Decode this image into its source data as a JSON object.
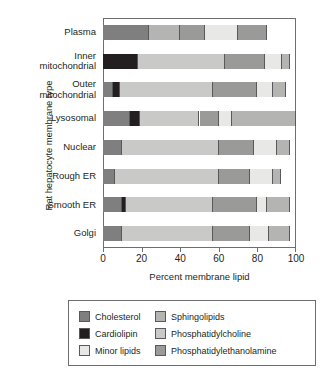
{
  "chart_data": {
    "type": "bar",
    "orientation": "horizontal",
    "stacked": true,
    "title": "",
    "xlabel": "Percent membrane lipid",
    "ylabel": "Rat hepatocyte membrane type",
    "xlim": [
      0,
      100
    ],
    "xticks": [
      0,
      20,
      40,
      60,
      80,
      100
    ],
    "grid": false,
    "legend_position": "below",
    "categories": [
      "Plasma",
      "Inner mitochondrial",
      "Outer mitochondrial",
      "Lysosomal",
      "Nuclear",
      "Rough ER",
      "Smooth ER",
      "Golgi"
    ],
    "category_lines": [
      [
        "Plasma"
      ],
      [
        "Inner",
        "mitochondrial"
      ],
      [
        "Outer",
        "mitochondrial"
      ],
      [
        "Lysosomal"
      ],
      [
        "Nuclear"
      ],
      [
        "Rough ER"
      ],
      [
        "Smooth ER"
      ],
      [
        "Golgi"
      ]
    ],
    "series": [
      {
        "name": "Cholesterol",
        "key": "cholesterol",
        "color": "#7f7f7f",
        "values": [
          24,
          0,
          5,
          14,
          10,
          6,
          10,
          10
        ]
      },
      {
        "name": "Cardiolipin",
        "key": "cardiolipin",
        "color": "#231f20",
        "values": [
          0,
          18,
          4,
          5,
          0,
          0,
          2,
          0
        ]
      },
      {
        "name": "Minor lipids",
        "key": "minor",
        "color": "#e8e8e6",
        "values": [
          17,
          9,
          8,
          7,
          12,
          12,
          5,
          10
        ]
      },
      {
        "name": "Sphingolipids",
        "key": "sphingolipids",
        "color": "#b4b4b2",
        "values": [
          16,
          4,
          7,
          33,
          7,
          4,
          12,
          11
        ]
      },
      {
        "name": "Phosphatidylcholine",
        "key": "pc",
        "color": "#c9c9c7",
        "values": [
          0,
          45,
          48,
          31,
          50,
          54,
          45,
          47
        ]
      },
      {
        "name": "Phosphatidylethanolamine",
        "key": "pe",
        "color": "#9a9a98",
        "values": [
          28,
          21,
          23,
          10,
          18,
          16,
          23,
          19
        ]
      }
    ],
    "stacks": [
      {
        "category": "Plasma",
        "segments": [
          {
            "key": "cholesterol",
            "start": 0,
            "end": 24
          },
          {
            "key": "sphingolipids",
            "start": 24,
            "end": 40
          },
          {
            "key": "pe",
            "start": 40,
            "end": 53
          },
          {
            "key": "minor",
            "start": 53,
            "end": 70
          },
          {
            "key": "pe",
            "start": 70,
            "end": 85
          }
        ]
      },
      {
        "category": "Inner mitochondrial",
        "segments": [
          {
            "key": "cardiolipin",
            "start": 0,
            "end": 18
          },
          {
            "key": "pc",
            "start": 18,
            "end": 63
          },
          {
            "key": "pe",
            "start": 63,
            "end": 84
          },
          {
            "key": "minor",
            "start": 84,
            "end": 93
          },
          {
            "key": "sphingolipids",
            "start": 93,
            "end": 97
          }
        ]
      },
      {
        "category": "Outer mitochondrial",
        "segments": [
          {
            "key": "cholesterol",
            "start": 0,
            "end": 5
          },
          {
            "key": "cardiolipin",
            "start": 5,
            "end": 9
          },
          {
            "key": "pc",
            "start": 9,
            "end": 57
          },
          {
            "key": "pe",
            "start": 57,
            "end": 80
          },
          {
            "key": "minor",
            "start": 80,
            "end": 88
          },
          {
            "key": "sphingolipids",
            "start": 88,
            "end": 95
          }
        ]
      },
      {
        "category": "Lysosomal",
        "segments": [
          {
            "key": "cholesterol",
            "start": 0,
            "end": 14
          },
          {
            "key": "cardiolipin",
            "start": 14,
            "end": 19
          },
          {
            "key": "pc",
            "start": 19,
            "end": 50
          },
          {
            "key": "pe",
            "start": 50,
            "end": 60
          },
          {
            "key": "minor",
            "start": 60,
            "end": 67
          },
          {
            "key": "sphingolipids",
            "start": 67,
            "end": 100
          }
        ]
      },
      {
        "category": "Nuclear",
        "segments": [
          {
            "key": "cholesterol",
            "start": 0,
            "end": 10
          },
          {
            "key": "pc",
            "start": 10,
            "end": 60
          },
          {
            "key": "pe",
            "start": 60,
            "end": 78
          },
          {
            "key": "minor",
            "start": 78,
            "end": 90
          },
          {
            "key": "sphingolipids",
            "start": 90,
            "end": 97
          }
        ]
      },
      {
        "category": "Rough ER",
        "segments": [
          {
            "key": "cholesterol",
            "start": 0,
            "end": 6
          },
          {
            "key": "pc",
            "start": 6,
            "end": 60
          },
          {
            "key": "pe",
            "start": 60,
            "end": 76
          },
          {
            "key": "minor",
            "start": 76,
            "end": 88
          },
          {
            "key": "sphingolipids",
            "start": 88,
            "end": 92
          }
        ]
      },
      {
        "category": "Smooth ER",
        "segments": [
          {
            "key": "cholesterol",
            "start": 0,
            "end": 10
          },
          {
            "key": "cardiolipin",
            "start": 10,
            "end": 12
          },
          {
            "key": "pc",
            "start": 12,
            "end": 57
          },
          {
            "key": "pe",
            "start": 57,
            "end": 80
          },
          {
            "key": "minor",
            "start": 80,
            "end": 85
          },
          {
            "key": "sphingolipids",
            "start": 85,
            "end": 97
          }
        ]
      },
      {
        "category": "Golgi",
        "segments": [
          {
            "key": "cholesterol",
            "start": 0,
            "end": 10
          },
          {
            "key": "pc",
            "start": 10,
            "end": 57
          },
          {
            "key": "pe",
            "start": 57,
            "end": 76
          },
          {
            "key": "minor",
            "start": 76,
            "end": 86
          },
          {
            "key": "sphingolipids",
            "start": 86,
            "end": 97
          }
        ]
      }
    ],
    "legend": [
      {
        "label": "Cholesterol",
        "key": "cholesterol",
        "color": "#7f7f7f"
      },
      {
        "label": "Sphingolipids",
        "key": "sphingolipids",
        "color": "#b4b4b2"
      },
      {
        "label": "Cardiolipin",
        "key": "cardiolipin",
        "color": "#231f20"
      },
      {
        "label": "Phosphatidylcholine",
        "key": "pc",
        "color": "#c9c9c7"
      },
      {
        "label": "Minor lipids",
        "key": "minor",
        "color": "#e8e8e6"
      },
      {
        "label": "Phosphatidylethanolamine",
        "key": "pe",
        "color": "#9a9a98"
      }
    ],
    "colors": {
      "cholesterol": "#7f7f7f",
      "cardiolipin": "#231f20",
      "minor": "#e8e8e6",
      "sphingolipids": "#b4b4b2",
      "pc": "#c9c9c7",
      "pe": "#9a9a98",
      "axis": "#6d6e71",
      "text": "#231f20",
      "background": "#ffffff"
    }
  }
}
